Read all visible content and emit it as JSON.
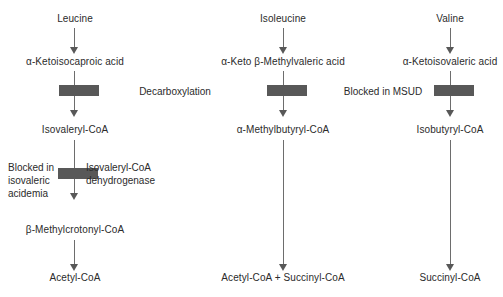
{
  "diagram": {
    "colors": {
      "text": "#2b2b2b",
      "arrow": "#6d6d6d",
      "block": "#585858",
      "background": "#ffffff"
    },
    "columns": [
      {
        "id": "leucine-pathway",
        "nodes": [
          "Leucine",
          "α-Ketoisocaproic acid",
          "Isovaleryl-CoA",
          "β-Methylcrotonyl-CoA",
          "Acetyl-CoA"
        ]
      },
      {
        "id": "isoleucine-pathway",
        "nodes": [
          "Isoleucine",
          "α-Keto β-Methylvaleric acid",
          "α-Methylbutyryl-CoA",
          "Acetyl-CoA + Succinyl-CoA"
        ]
      },
      {
        "id": "valine-pathway",
        "nodes": [
          "Valine",
          "α-Ketoisovaleric acid",
          "Isobutyryl-CoA",
          "Succinyl-CoA"
        ]
      }
    ],
    "annotations": {
      "decarboxylation": "Decarboxylation",
      "blocked_in_msud": "Blocked in MSUD",
      "blocked_in_iva_line1": "Blocked in",
      "blocked_in_iva_line2": "isovaleric",
      "blocked_in_iva_line3": "acidemia",
      "enzyme_line1": "Isovaleryl-CoA",
      "enzyme_line2": "dehydrogenase"
    }
  }
}
